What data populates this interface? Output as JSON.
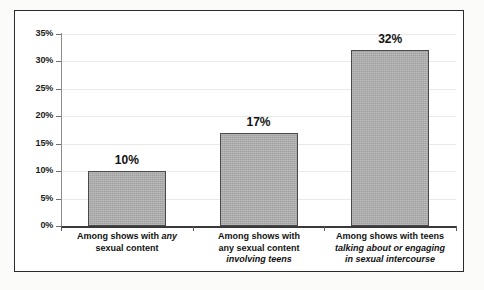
{
  "chart_data": {
    "type": "bar",
    "title": "",
    "subtitle": "",
    "xlabel": "",
    "ylabel": "",
    "ylim": [
      0,
      35
    ],
    "ytick_values": [
      0,
      5,
      10,
      15,
      20,
      25,
      30,
      35
    ],
    "ytick_labels": [
      "0%",
      "5%",
      "10%",
      "15%",
      "20%",
      "25%",
      "30%",
      "35%"
    ],
    "grid": true,
    "grid_axis": "y",
    "legend": false,
    "legend_position": "none",
    "orientation": "vertical",
    "categories": [
      "Among shows with any sexual content",
      "Among shows with any sexual content involving teens",
      "Among shows with teens talking about or engaging in sexual intercourse"
    ],
    "values": [
      10,
      17,
      32
    ],
    "value_labels": [
      "10%",
      "17%",
      "32%"
    ],
    "bar_color": "#a9a9a9",
    "bar_border_color": "#4a4a4a",
    "frame_color": "#2b2b2b",
    "axis_color": "#3a3a3a",
    "gridline_color": "#e9e9e9",
    "background": "#ffffff"
  },
  "axis": {
    "y_ticks": [
      {
        "label": "35%",
        "value": 35
      },
      {
        "label": "30%",
        "value": 30
      },
      {
        "label": "25%",
        "value": 25
      },
      {
        "label": "20%",
        "value": 20
      },
      {
        "label": "15%",
        "value": 15
      },
      {
        "label": "10%",
        "value": 10
      },
      {
        "label": "5%",
        "value": 5
      },
      {
        "label": "0%",
        "value": 0
      }
    ]
  },
  "bars": [
    {
      "value_label": "10%",
      "value": 10,
      "label_lines": [
        {
          "segments": [
            {
              "text": "Among shows with ",
              "italic": false
            },
            {
              "text": "any",
              "italic": true
            }
          ]
        },
        {
          "segments": [
            {
              "text": "sexual content",
              "italic": false
            }
          ]
        }
      ]
    },
    {
      "value_label": "17%",
      "value": 17,
      "label_lines": [
        {
          "segments": [
            {
              "text": "Among shows with",
              "italic": false
            }
          ]
        },
        {
          "segments": [
            {
              "text": "any sexual content",
              "italic": false
            }
          ]
        },
        {
          "segments": [
            {
              "text": "involving teens",
              "italic": true
            }
          ]
        }
      ]
    },
    {
      "value_label": "32%",
      "value": 32,
      "label_lines": [
        {
          "segments": [
            {
              "text": "Among shows with teens",
              "italic": false
            }
          ]
        },
        {
          "segments": [
            {
              "text": "talking about or engaging",
              "italic": true
            }
          ]
        },
        {
          "segments": [
            {
              "text": "in sexual intercourse",
              "italic": true
            }
          ]
        }
      ]
    }
  ]
}
